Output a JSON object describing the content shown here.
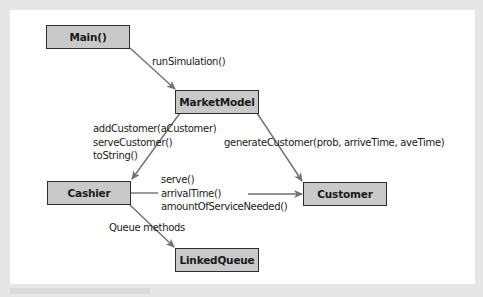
{
  "diagram": {
    "nodes": {
      "main": {
        "label": "Main()"
      },
      "market_model": {
        "label": "MarketModel"
      },
      "cashier": {
        "label": "Cashier"
      },
      "customer": {
        "label": "Customer"
      },
      "linked_queue": {
        "label": "LinkedQueue"
      }
    },
    "edges": {
      "main_to_market": {
        "from": "Main()",
        "to": "MarketModel",
        "label": "runSimulation()"
      },
      "market_to_cashier": {
        "from": "MarketModel",
        "to": "Cashier",
        "lines": [
          "addCustomer(aCustomer)",
          "serveCustomer()",
          "toString()"
        ]
      },
      "market_to_customer": {
        "from": "MarketModel",
        "to": "Customer",
        "label": "generateCustomer(prob, arriveTime, aveTime)"
      },
      "cashier_to_customer": {
        "from": "Cashier",
        "to": "Customer",
        "lines": [
          "serve()",
          "arrivalTime()",
          "amountOfServiceNeeded()"
        ]
      },
      "cashier_to_queue": {
        "from": "Cashier",
        "to": "LinkedQueue",
        "label": "Queue methods"
      }
    },
    "colors": {
      "node_fill": "#c9c9c9",
      "node_border": "#2e2e2e",
      "arrow": "#707070",
      "panel": "#ffffff",
      "frame": "#e6e6e6"
    }
  }
}
